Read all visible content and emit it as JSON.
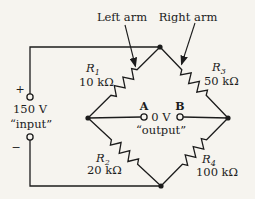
{
  "figure": {
    "type": "circuit-diagram",
    "name": "Wheatstone bridge"
  },
  "annotations": {
    "left_arm": "Left arm",
    "right_arm": "Right arm"
  },
  "source": {
    "plus": "+",
    "minus": "−",
    "voltage": "150 V",
    "label": "“input”"
  },
  "output": {
    "terminal_a": "A",
    "terminal_b": "B",
    "voltage": "0 V",
    "label": "“output”"
  },
  "resistors": [
    {
      "id": "R1",
      "symbol": "R",
      "subscript": "1",
      "value": "10 kΩ",
      "arm": "top-left"
    },
    {
      "id": "R2",
      "symbol": "R",
      "subscript": "2",
      "value": "20 kΩ",
      "arm": "bottom-left"
    },
    {
      "id": "R3",
      "symbol": "R",
      "subscript": "3",
      "value": "50 kΩ",
      "arm": "top-right"
    },
    {
      "id": "R4",
      "symbol": "R",
      "subscript": "4",
      "value": "100 kΩ",
      "arm": "bottom-right"
    }
  ],
  "colors": {
    "background": "#f6f4ef",
    "ink": "#1c1c1c"
  }
}
